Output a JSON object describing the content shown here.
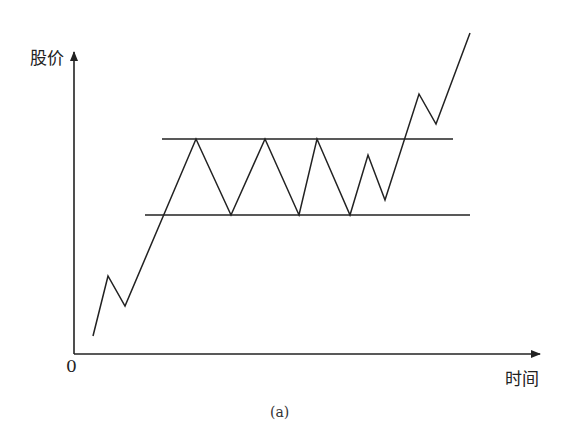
{
  "figure": {
    "caption": "(a)",
    "y_axis_label": "股价",
    "x_axis_label": "时间",
    "origin_label": "0",
    "line_color": "#222222"
  },
  "chart_data": {
    "type": "line",
    "title": "",
    "xlabel": "时间",
    "ylabel": "股价",
    "resistance_line": {
      "x": [
        162,
        453
      ],
      "y": 139
    },
    "support_line": {
      "x": [
        145,
        470
      ],
      "y": 215
    },
    "price_path_px": [
      [
        93,
        336
      ],
      [
        108,
        276
      ],
      [
        125,
        306
      ],
      [
        196,
        139
      ],
      [
        231,
        215
      ],
      [
        265,
        139
      ],
      [
        299,
        215
      ],
      [
        317,
        139
      ],
      [
        350,
        215
      ],
      [
        368,
        155
      ],
      [
        385,
        200
      ],
      [
        419,
        94
      ],
      [
        436,
        124
      ],
      [
        470,
        33
      ]
    ],
    "axes_origin_px": [
      74,
      354
    ],
    "legend": []
  }
}
